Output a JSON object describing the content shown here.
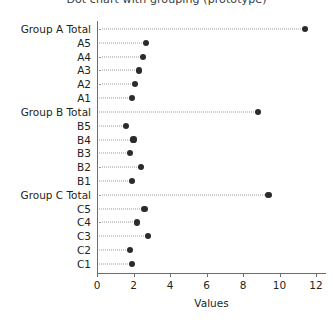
{
  "chart_data": {
    "type": "scatter",
    "title": "Dot chart with grouping (prototype)",
    "xlabel": "Values",
    "ylabel": "",
    "xlim": [
      0,
      12.6
    ],
    "xticks": [
      0,
      2,
      4,
      6,
      8,
      10,
      12
    ],
    "xticklabels": [
      "0",
      "2",
      "4",
      "6",
      "8",
      "10",
      "12"
    ],
    "grid": false,
    "leader_lines": true,
    "legend": null,
    "marker": "circle",
    "marker_color": "#2b2b2b",
    "categories": [
      "Group A Total",
      "A5",
      "A4",
      "A3",
      "A2",
      "A1",
      "Group B Total",
      "B5",
      "B4",
      "B3",
      "B2",
      "B1",
      "Group C Total",
      "C5",
      "C4",
      "C3",
      "C2",
      "C1"
    ],
    "values": [
      11.4,
      2.7,
      2.5,
      2.3,
      2.1,
      1.9,
      8.8,
      1.6,
      2.0,
      1.8,
      2.4,
      1.9,
      9.4,
      2.6,
      2.2,
      2.8,
      1.8,
      1.9
    ],
    "is_total": [
      true,
      false,
      false,
      false,
      false,
      false,
      true,
      false,
      false,
      false,
      false,
      false,
      true,
      false,
      false,
      false,
      false,
      false
    ]
  },
  "colors": {
    "marker": "#2b2b2b",
    "axis": "#6d6d6d",
    "leader": "#9a9a9a",
    "text": "#231f20",
    "background": "#ffffff"
  }
}
